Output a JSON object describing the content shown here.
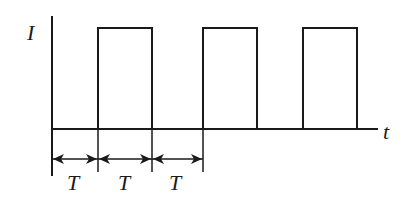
{
  "diagram": {
    "type": "square-wave current vs time",
    "y_axis_label": "I",
    "x_axis_label": "t",
    "period_label": "T",
    "period_markers": [
      "T",
      "T",
      "T"
    ],
    "pulses": [
      {
        "start_period": 1,
        "end_period": 2
      },
      {
        "start_period": 3,
        "end_period": 4
      },
      {
        "start_period": 5,
        "end_period": 6
      }
    ],
    "line_color": "#1a1a1a",
    "background": "#ffffff"
  }
}
